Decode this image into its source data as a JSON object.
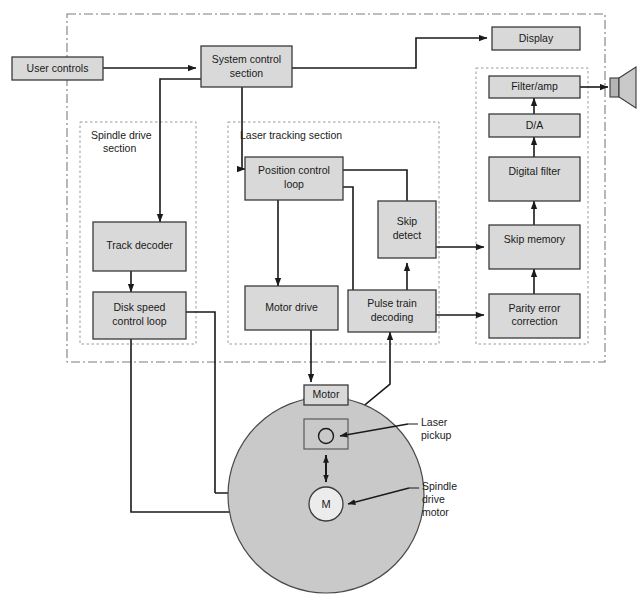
{
  "diagram": {
    "colors": {
      "block_fill": "#d9d9d9",
      "block_stroke": "#3a3a3a",
      "disc_fill": "#c9c9c9",
      "line": "#1a1a1a",
      "dashed": "#8a8a8a",
      "background": "#ffffff",
      "hub_fill": "#ececec"
    },
    "sections": [
      {
        "id": "spindle",
        "label": "Spindle drive\nsection",
        "label_line1": "Spindle drive",
        "label_line2": "section"
      },
      {
        "id": "laser",
        "label": "Laser tracking section",
        "label_line1": "Laser tracking section",
        "label_line2": ""
      },
      {
        "id": "audio",
        "label": "Audio section",
        "label_line1": "Audio section",
        "label_line2": ""
      }
    ],
    "blocks": [
      {
        "id": "user-controls",
        "line1": "User controls",
        "line2": ""
      },
      {
        "id": "system-control",
        "line1": "System control",
        "line2": "section"
      },
      {
        "id": "display",
        "line1": "Display",
        "line2": ""
      },
      {
        "id": "filter-amp",
        "line1": "Filter/amp",
        "line2": ""
      },
      {
        "id": "da",
        "line1": "D/A",
        "line2": ""
      },
      {
        "id": "digital-filter",
        "line1": "Digital filter",
        "line2": ""
      },
      {
        "id": "skip-memory",
        "line1": "Skip memory",
        "line2": ""
      },
      {
        "id": "parity-error",
        "line1": "Parity error",
        "line2": "correction"
      },
      {
        "id": "position-control",
        "line1": "Position control",
        "line2": "loop"
      },
      {
        "id": "skip-detect",
        "line1": "Skip",
        "line2": "detect"
      },
      {
        "id": "motor-drive",
        "line1": "Motor drive",
        "line2": ""
      },
      {
        "id": "pulse-train",
        "line1": "Pulse train",
        "line2": "decoding"
      },
      {
        "id": "track-decoder",
        "line1": "Track decoder",
        "line2": ""
      },
      {
        "id": "disk-speed",
        "line1": "Disk speed",
        "line2": "control loop"
      },
      {
        "id": "motor",
        "line1": "Motor",
        "line2": ""
      }
    ],
    "annotations": [
      {
        "id": "laser-pickup",
        "line1": "Laser",
        "line2": "pickup",
        "line3": ""
      },
      {
        "id": "spindle-drive-motor",
        "line1": "Spindle",
        "line2": "drive",
        "line3": "motor"
      }
    ],
    "hub_label": "M",
    "speaker_label": "speaker"
  }
}
